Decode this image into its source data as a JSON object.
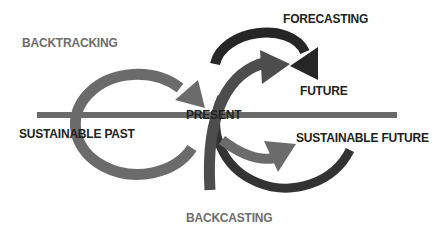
{
  "diagram": {
    "labels": {
      "backtracking": "BACKTRACKING",
      "forecasting": "FORECASTING",
      "future": "FUTURE",
      "present": "PRESENT",
      "sustainable_past": "SUSTAINABLE PAST",
      "sustainable_future": "SUSTAINABLE FUTURE",
      "backcasting": "BACKCASTING"
    },
    "colors": {
      "timeline": "#6a6a6a",
      "backtracking_arrow": "#6b6b6b",
      "forecasting_arrow": "#262626",
      "present_to_future_arrow": "#4d4d4d",
      "backcasting_arrow": "#333333",
      "present_to_sustainable_future_arrow": "#6b6b6b",
      "label_gray": "#6e6e6e",
      "label_dark": "#222222"
    }
  }
}
